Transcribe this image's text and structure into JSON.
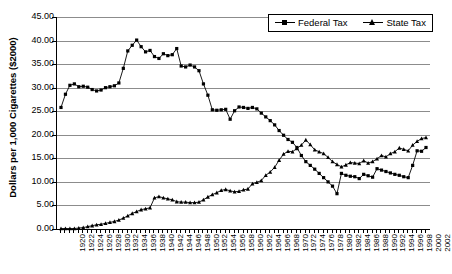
{
  "chart_data": {
    "type": "line",
    "title": "",
    "xlabel": "",
    "ylabel": "Dollars per 1,000 Cigarettes ($2000)",
    "ylim": [
      0,
      45
    ],
    "ytick_step": 5,
    "ytick_labels": [
      "0.00",
      "5.00",
      "10.00",
      "15.00",
      "20.00",
      "25.00",
      "30.00",
      "35.00",
      "40.00",
      "45.00"
    ],
    "xlim": [
      1920,
      2002
    ],
    "xtick_step": 2,
    "xtick_labels": [
      "1920",
      "1922",
      "1924",
      "1926",
      "1928",
      "1930",
      "1932",
      "1934",
      "1936",
      "1938",
      "1940",
      "1942",
      "1944",
      "1946",
      "1948",
      "1950",
      "1952",
      "1954",
      "1956",
      "1958",
      "1960",
      "1962",
      "1964",
      "1966",
      "1968",
      "1970",
      "1972",
      "1974",
      "1976",
      "1978",
      "1980",
      "1982",
      "1984",
      "1986",
      "1988",
      "1990",
      "1992",
      "1994",
      "1996",
      "1998",
      "2000",
      "2002"
    ],
    "grid": "horizontal",
    "legend_position": "top-right",
    "x": [
      1920,
      1921,
      1922,
      1923,
      1924,
      1925,
      1926,
      1927,
      1928,
      1929,
      1930,
      1931,
      1932,
      1933,
      1934,
      1935,
      1936,
      1937,
      1938,
      1939,
      1940,
      1941,
      1942,
      1943,
      1944,
      1945,
      1946,
      1947,
      1948,
      1949,
      1950,
      1951,
      1952,
      1953,
      1954,
      1955,
      1956,
      1957,
      1958,
      1959,
      1960,
      1961,
      1962,
      1963,
      1964,
      1965,
      1966,
      1967,
      1968,
      1969,
      1970,
      1971,
      1972,
      1973,
      1974,
      1975,
      1976,
      1977,
      1978,
      1979,
      1980,
      1981,
      1982,
      1983,
      1984,
      1985,
      1986,
      1987,
      1988,
      1989,
      1990,
      1991,
      1992,
      1993,
      1994,
      1995,
      1996,
      1997,
      1998,
      1999,
      2000,
      2001,
      2002
    ],
    "series": [
      {
        "name": "Federal Tax",
        "marker": "square",
        "values": [
          25.8,
          28.6,
          30.5,
          30.8,
          30.2,
          30.3,
          30.1,
          29.6,
          29.3,
          29.5,
          30.0,
          30.2,
          30.4,
          31.0,
          34.1,
          37.8,
          39.0,
          40.1,
          38.7,
          37.6,
          37.9,
          36.6,
          36.2,
          37.2,
          36.8,
          37.0,
          38.3,
          34.6,
          34.4,
          34.8,
          34.4,
          33.6,
          30.8,
          28.4,
          25.3,
          25.2,
          25.3,
          25.4,
          23.3,
          25.1,
          25.9,
          25.8,
          25.6,
          25.8,
          25.5,
          24.6,
          23.8,
          23.0,
          22.1,
          20.9,
          19.9,
          19.0,
          18.4,
          17.3,
          15.6,
          14.3,
          13.5,
          12.7,
          11.8,
          10.9,
          10.0,
          9.1,
          7.5,
          11.8,
          11.4,
          11.2,
          11.1,
          10.7,
          11.6,
          11.3,
          11.0,
          12.8,
          12.5,
          12.2,
          11.9,
          11.6,
          11.4,
          11.1,
          10.9,
          13.5,
          16.6,
          16.5,
          17.3
        ],
        "color": "#000000"
      },
      {
        "name": "State Tax",
        "marker": "triangle",
        "values": [
          0.1,
          0.1,
          0.1,
          0.1,
          0.2,
          0.3,
          0.5,
          0.7,
          0.9,
          1.0,
          1.2,
          1.4,
          1.6,
          1.9,
          2.3,
          2.8,
          3.3,
          3.7,
          4.1,
          4.3,
          4.5,
          6.6,
          6.9,
          6.6,
          6.4,
          6.2,
          5.8,
          5.7,
          5.7,
          5.6,
          5.6,
          5.7,
          6.2,
          6.8,
          7.3,
          7.7,
          8.2,
          8.4,
          8.1,
          7.9,
          8.0,
          8.3,
          8.5,
          9.6,
          9.9,
          10.3,
          11.4,
          12.1,
          13.1,
          14.6,
          15.9,
          16.5,
          16.4,
          17.1,
          17.8,
          18.9,
          17.9,
          16.8,
          16.4,
          16.0,
          15.2,
          14.3,
          13.7,
          13.2,
          13.6,
          14.1,
          14.0,
          13.9,
          14.5,
          14.0,
          14.3,
          14.9,
          15.6,
          15.3,
          16.0,
          16.4,
          17.2,
          16.9,
          16.6,
          17.8,
          18.6,
          19.2,
          19.4
        ],
        "color": "#000000"
      }
    ]
  },
  "legend": {
    "items": [
      {
        "label": "Federal Tax",
        "marker": "square"
      },
      {
        "label": "State Tax",
        "marker": "triangle"
      }
    ]
  }
}
